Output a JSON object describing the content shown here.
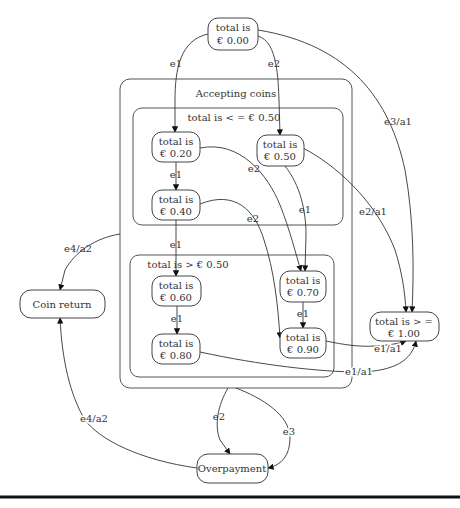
{
  "diagram": {
    "type": "state-machine",
    "clusters": {
      "accepting": {
        "label": "Accepting coins"
      },
      "low": {
        "label": "total is < = € 0.50"
      },
      "high": {
        "label": "total is > € 0.50"
      }
    },
    "states": {
      "s000": {
        "line1": "total is",
        "line2": "€ 0.00"
      },
      "s020": {
        "line1": "total is",
        "line2": "€ 0.20"
      },
      "s040": {
        "line1": "total is",
        "line2": "€ 0.40"
      },
      "s050": {
        "line1": "total is",
        "line2": "€ 0.50"
      },
      "s060": {
        "line1": "total is",
        "line2": "€ 0.60"
      },
      "s070": {
        "line1": "total is",
        "line2": "€ 0.70"
      },
      "s080": {
        "line1": "total is",
        "line2": "€ 0.80"
      },
      "s090": {
        "line1": "total is",
        "line2": "€ 0.90"
      },
      "s100": {
        "line1": "total is > =",
        "line2": "€ 1.00"
      },
      "coin_return": {
        "label": "Coin return"
      },
      "overpayment": {
        "label": "Overpayment"
      }
    },
    "edges": [
      {
        "from": "€ 0.00",
        "to": "€ 0.20",
        "label": "e1"
      },
      {
        "from": "€ 0.00",
        "to": "€ 0.50",
        "label": "e2"
      },
      {
        "from": "€ 0.00",
        "to": "total is > = € 1.00",
        "label": "e3/a1"
      },
      {
        "from": "€ 0.20",
        "to": "€ 0.40",
        "label": "e1"
      },
      {
        "from": "€ 0.20",
        "to": "€ 0.70",
        "label": "e2"
      },
      {
        "from": "€ 0.40",
        "to": "€ 0.60",
        "label": "e1"
      },
      {
        "from": "€ 0.40",
        "to": "€ 0.90",
        "label": "e2"
      },
      {
        "from": "€ 0.50",
        "to": "€ 0.70",
        "label": "e1"
      },
      {
        "from": "€ 0.50",
        "to": "total is > = € 1.00",
        "label": "e2/a1"
      },
      {
        "from": "€ 0.60",
        "to": "€ 0.80",
        "label": "e1"
      },
      {
        "from": "€ 0.70",
        "to": "€ 0.90",
        "label": "e1"
      },
      {
        "from": "€ 0.90",
        "to": "total is > = € 1.00",
        "label": "e1/a1"
      },
      {
        "from": "€ 0.80",
        "to": "total is > = € 1.00",
        "label": "e1/a1"
      },
      {
        "from": "Accepting coins",
        "to": "Coin return",
        "label": "e4/a2"
      },
      {
        "from": "Accepting coins",
        "to": "Overpayment",
        "label": "e2"
      },
      {
        "from": "Accepting coins",
        "to": "Overpayment",
        "label": "e3"
      },
      {
        "from": "Overpayment",
        "to": "Coin return",
        "label": "e4/a2"
      }
    ],
    "edge_labels": {
      "e000_020": "e1",
      "e000_050": "e2",
      "e000_100": "e3/a1",
      "e020_040": "e1",
      "e020_070": "e2",
      "e040_060": "e1",
      "e040_090": "e2",
      "e050_070": "e1",
      "e050_100": "e2/a1",
      "e060_080": "e1",
      "e070_090": "e1",
      "e090_100": "e1/a1",
      "e080_100": "e1/a1",
      "eacc_coin": "e4/a2",
      "eacc_over_e2": "e2",
      "eacc_over_e3": "e3",
      "eover_coin": "e4/a2"
    }
  }
}
